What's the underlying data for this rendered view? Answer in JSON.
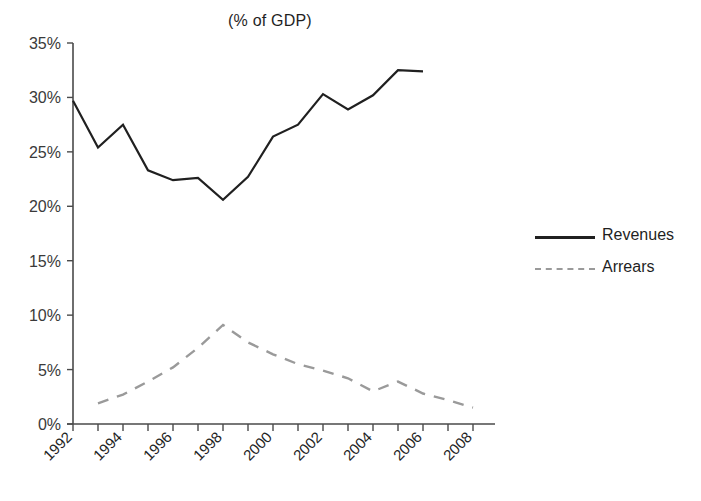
{
  "chart_data": {
    "type": "line",
    "title": "(% of GDP)",
    "xlabel": "",
    "ylabel": "",
    "xlim": [
      1992,
      2008
    ],
    "ylim": [
      0,
      35
    ],
    "yticks": [
      0,
      5,
      10,
      15,
      20,
      25,
      30,
      35
    ],
    "ytick_labels": [
      "0%",
      "5%",
      "10%",
      "15%",
      "20%",
      "25%",
      "30%",
      "35%"
    ],
    "xticks": [
      1992,
      1994,
      1996,
      1998,
      2000,
      2002,
      2004,
      2006,
      2008
    ],
    "xtick_labels": [
      "1992",
      "1994",
      "1996",
      "1998",
      "2000",
      "2002",
      "2004",
      "2006",
      "2008"
    ],
    "xtick_minor": [
      1993,
      1995,
      1997,
      1999,
      2001,
      2003,
      2005,
      2007
    ],
    "grid": false,
    "legend_position": "right",
    "series": [
      {
        "name": "Revenues",
        "style": "solid",
        "color": "#202020",
        "x": [
          1992,
          1993,
          1994,
          1995,
          1996,
          1997,
          1998,
          1999,
          2000,
          2001,
          2002,
          2003,
          2004,
          2005,
          2006
        ],
        "values": [
          29.7,
          25.4,
          27.5,
          23.3,
          22.4,
          22.6,
          20.6,
          22.7,
          26.4,
          27.5,
          30.3,
          28.9,
          30.2,
          32.5,
          32.4
        ]
      },
      {
        "name": "Arrears",
        "style": "dashed",
        "color": "#9a9a9a",
        "x": [
          1993,
          1994,
          1995,
          1996,
          1997,
          1998,
          1999,
          2000,
          2001,
          2002,
          2003,
          2004,
          2005,
          2006,
          2007,
          2008
        ],
        "values": [
          1.9,
          2.7,
          3.9,
          5.2,
          7.0,
          9.1,
          7.5,
          6.4,
          5.5,
          4.9,
          4.2,
          3.0,
          3.9,
          2.8,
          2.2,
          1.5
        ]
      }
    ]
  },
  "legend": {
    "revenues": "Revenues",
    "arrears": "Arrears"
  },
  "axis": {
    "title": "(% of GDP)"
  }
}
